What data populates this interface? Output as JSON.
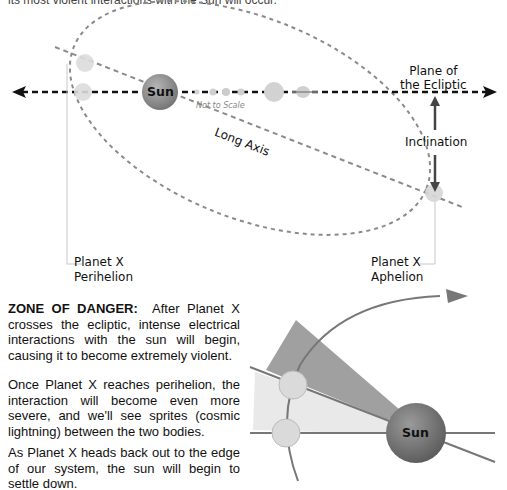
{
  "intro": {
    "text": "its most violent interactions with the Sun will occur."
  },
  "orbit_diagram": {
    "sun_label": "Sun",
    "not_to_scale": "Not to Scale",
    "plane_of_ecliptic_line1": "Plane of",
    "plane_of_ecliptic_line2": "the Ecliptic",
    "long_axis": "Long Axis",
    "inclination": "Inclination",
    "perihelion_line1": "Planet X",
    "perihelion_line2": "Perihelion",
    "aphelion_line1": "Planet X",
    "aphelion_line2": "Aphelion"
  },
  "zone_diagram": {
    "sun_label": "Sun"
  },
  "paragraphs": {
    "p1_heading": "ZONE OF DANGER:",
    "p1_body": "After Planet X crosses the ecliptic, intense electrical interactions with the sun will begin, causing it to become extremely violent.",
    "p2": "Once Planet X reaches  perihelion, the interaction will become even more severe, and we'll see sprites (cosmic lightning) between the two bodies.",
    "p3": "As Planet X heads back out to the edge of our system, the sun will begin to settle down."
  },
  "colors": {
    "dashed_gray": "#8a8a8a",
    "ecliptic_black": "#111111",
    "sun_fill": "#8e8e8e",
    "planet_fill": "#dddddd",
    "wedge_dark": "#9a9a9a",
    "wedge_light": "#e8e8e8"
  }
}
